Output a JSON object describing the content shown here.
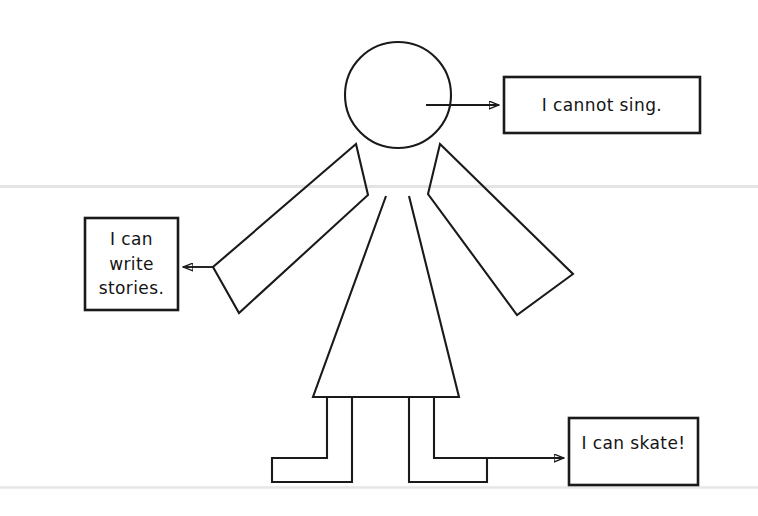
{
  "page": {
    "width": 758,
    "height": 516,
    "background_color": "#ffffff",
    "ink_color": "#1a1a1a",
    "rule_color": "#e2e2e2"
  },
  "figure": {
    "name": "stick-figure-person",
    "parts": [
      "head",
      "left-arm",
      "right-arm",
      "dress-body",
      "left-leg",
      "right-leg"
    ]
  },
  "rules": [
    {
      "name": "horizontal-rule-upper",
      "y": 186
    },
    {
      "name": "horizontal-rule-lower",
      "y": 487
    }
  ],
  "callouts": [
    {
      "id": "cannot-sing",
      "text": "I cannot sing.",
      "anchor": "head",
      "arrow_direction": "right",
      "box": {
        "x": 504,
        "y": 77,
        "w": 196,
        "h": 56
      }
    },
    {
      "id": "write-stories",
      "text": "I can write\nstories.",
      "anchor": "left-arm",
      "arrow_direction": "left",
      "box": {
        "x": 85,
        "y": 218,
        "w": 93,
        "h": 92
      }
    },
    {
      "id": "skate",
      "text": "I can skate!",
      "anchor": "right-foot",
      "arrow_direction": "right",
      "box": {
        "x": 569,
        "y": 418,
        "w": 129,
        "h": 67
      }
    }
  ]
}
